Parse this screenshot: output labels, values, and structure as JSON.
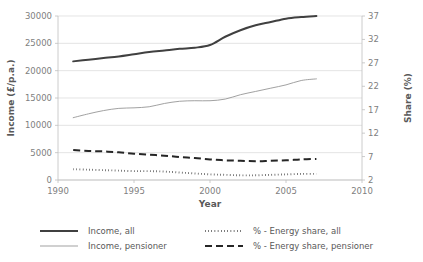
{
  "chart_data": {
    "type": "line",
    "title": "",
    "xlabel": "Year",
    "ylabel": "Income (£/p.a.)",
    "y2label": "Share (%)",
    "xlim": [
      1990,
      2010
    ],
    "ylim": [
      0,
      30000
    ],
    "y2lim": [
      2,
      37
    ],
    "grid": true,
    "legend_position": "bottom",
    "xticks": [
      "1990",
      "1995",
      "2000",
      "2005",
      "2010"
    ],
    "xtick_values": [
      1990,
      1995,
      2000,
      2005,
      2010
    ],
    "yticks": [
      "0",
      "5000",
      "10000",
      "15000",
      "20000",
      "25000",
      "30000"
    ],
    "ytick_values": [
      0,
      5000,
      10000,
      15000,
      20000,
      25000,
      30000
    ],
    "y2ticks": [
      "2",
      "7",
      "12",
      "17",
      "22",
      "27",
      "32",
      "37"
    ],
    "y2tick_values": [
      2,
      7,
      12,
      17,
      22,
      27,
      32,
      37
    ],
    "x": [
      1991,
      1992,
      1993,
      1994,
      1995,
      1996,
      1997,
      1998,
      1999,
      2000,
      2001,
      2002,
      2003,
      2004,
      2005,
      2006,
      2007
    ],
    "series": [
      {
        "name": "Income, all",
        "axis": "left",
        "style": "solid-thick",
        "color": "#404040",
        "values": [
          21700,
          22000,
          22300,
          22600,
          23000,
          23400,
          23700,
          24000,
          24200,
          24700,
          26200,
          27400,
          28300,
          28900,
          29500,
          29800,
          30000
        ]
      },
      {
        "name": "Income, pensioner",
        "axis": "left",
        "style": "solid-thin",
        "color": "#969696",
        "values": [
          11400,
          12100,
          12700,
          13100,
          13200,
          13400,
          14000,
          14400,
          14500,
          14500,
          14800,
          15600,
          16200,
          16800,
          17400,
          18200,
          18500
        ]
      },
      {
        "name": "% - Energy share, all",
        "axis": "right",
        "style": "dotted",
        "color": "#262626",
        "values": [
          4.3,
          4.2,
          4.1,
          4.0,
          3.9,
          3.9,
          3.8,
          3.6,
          3.4,
          3.2,
          3.1,
          3.0,
          3.0,
          3.1,
          3.2,
          3.3,
          3.3
        ]
      },
      {
        "name": "% - Energy share, pensioner",
        "axis": "right",
        "style": "dashed",
        "color": "#262626",
        "values": [
          8.4,
          8.2,
          8.1,
          7.9,
          7.6,
          7.4,
          7.2,
          6.9,
          6.7,
          6.4,
          6.2,
          6.1,
          6.0,
          6.1,
          6.2,
          6.4,
          6.5
        ]
      }
    ]
  },
  "legend": {
    "items": [
      {
        "label": "Income, all",
        "style": "solid-thick"
      },
      {
        "label": "% - Energy share, all",
        "style": "dotted"
      },
      {
        "label": "Income, pensioner",
        "style": "solid-thin"
      },
      {
        "label": "% - Energy share, pensioner",
        "style": "dashed"
      }
    ]
  },
  "colors": {
    "income_all": "#404040",
    "income_pensioner": "#969696",
    "share_all": "#262626",
    "share_pensioner": "#262626",
    "grid": "#d9d9d9",
    "axis": "#bfbfbf",
    "text": "#595959",
    "tick_text": "#808080"
  }
}
